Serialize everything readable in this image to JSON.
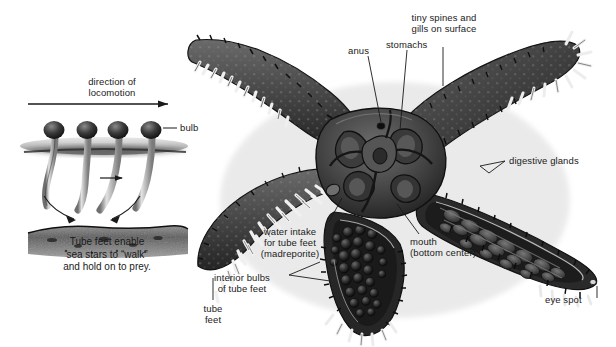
{
  "figure": {
    "background": "#ffffff",
    "body_color": "#3a3a3a",
    "line_color": "#1a1a1a",
    "text_color": "#1a1a1a"
  },
  "inset": {
    "heading": "direction of\nlocomotion",
    "bulb_label": "bulb",
    "caption": "Tube feet enable\nsea stars to “walk”\nand hold on to prey.",
    "arrow_icon": "arrow-right-icon",
    "feet_count": 4
  },
  "labels": {
    "anus": "anus",
    "stomachs": "stomachs",
    "spines_gills": "tiny spines and\ngills on surface",
    "digestive_glands": "digestive glands",
    "eye_spot": "eye spot",
    "mouth": "mouth\n(bottom center)",
    "madreporite": "water intake\nfor tube feet\n(madreporite)",
    "interior_bulbs": "interior bulbs\nof tube feet",
    "tube_feet": "tube\nfeet"
  }
}
